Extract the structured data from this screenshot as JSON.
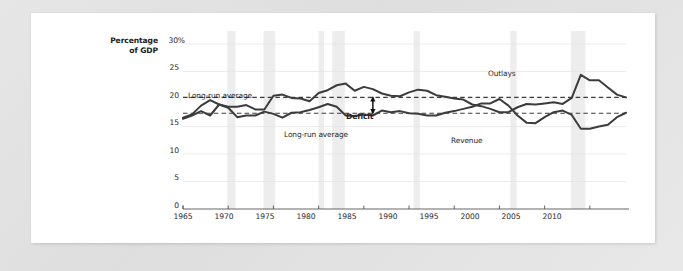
{
  "page": {
    "background_color": "#e3e3e3",
    "sheet_color": "#ffffff"
  },
  "chart_data": {
    "type": "line",
    "title": "",
    "subtitle": "",
    "xlabel": "",
    "ylabel": "Percentage of GDP",
    "ylabel_line1": "Percentage",
    "ylabel_line2": "of GDP",
    "xlim": [
      1965,
      2014
    ],
    "ylim": [
      0,
      30
    ],
    "ytick_labels": [
      "0",
      "5",
      "10",
      "15",
      "20",
      "25",
      "30%"
    ],
    "ytick_values": [
      0,
      5,
      10,
      15,
      20,
      25,
      30
    ],
    "xtick_labels": [
      "1965",
      "1970",
      "1975",
      "1980",
      "1985",
      "1990",
      "1995",
      "2000",
      "2005",
      "2010"
    ],
    "xtick_values": [
      1965,
      1970,
      1975,
      1980,
      1985,
      1990,
      1995,
      2000,
      2005,
      2010
    ],
    "grid": true,
    "legend": "inline-annotations",
    "line_color": "#3c3c3c",
    "reference_line_color": "#3c3c3c",
    "recession_band_color": "#ededed",
    "annotations": [
      {
        "name": "outlays-average-label",
        "text": "Long-run average",
        "x": 1969.2,
        "y": 21.6
      },
      {
        "name": "revenue-average-label",
        "text": "Long-run average",
        "x": 1980.6,
        "y": 15.6
      },
      {
        "name": "deficit-label",
        "text": "Deficit",
        "x": 1986.4,
        "y": 18.6
      },
      {
        "name": "outlays-label",
        "text": "Outlays",
        "x": 2006.0,
        "y": 25.4
      },
      {
        "name": "revenue-label",
        "text": "Revenue",
        "x": 2003.6,
        "y": 13.6
      }
    ],
    "reference_lines": [
      {
        "name": "outlays-long-run-average",
        "value": 20.3,
        "style": "dashed"
      },
      {
        "name": "revenue-long-run-average",
        "value": 17.4,
        "style": "dashed"
      }
    ],
    "deficit_arrow": {
      "x": 1986.0,
      "y_top": 20.3,
      "y_bottom": 17.4
    },
    "recession_bands": [
      {
        "start": 1969.9,
        "end": 1970.8
      },
      {
        "start": 1973.9,
        "end": 1975.2
      },
      {
        "start": 1980.0,
        "end": 1980.6
      },
      {
        "start": 1981.5,
        "end": 1982.9
      },
      {
        "start": 1990.5,
        "end": 1991.2
      },
      {
        "start": 2001.2,
        "end": 2001.9
      },
      {
        "start": 2007.9,
        "end": 2009.5
      }
    ],
    "series": [
      {
        "name": "Outlays",
        "x": [
          1965,
          1966,
          1967,
          1968,
          1969,
          1970,
          1971,
          1972,
          1973,
          1974,
          1975,
          1976,
          1977,
          1978,
          1979,
          1980,
          1981,
          1982,
          1983,
          1984,
          1985,
          1986,
          1987,
          1988,
          1989,
          1990,
          1991,
          1992,
          1993,
          1994,
          1995,
          1996,
          1997,
          1998,
          1999,
          2000,
          2001,
          2002,
          2003,
          2004,
          2005,
          2006,
          2007,
          2008,
          2009,
          2010,
          2011,
          2012,
          2013,
          2014
        ],
        "values": [
          16.6,
          17.2,
          18.8,
          19.8,
          19.0,
          18.6,
          18.6,
          18.9,
          18.1,
          18.1,
          20.6,
          20.8,
          20.2,
          20.1,
          19.6,
          21.1,
          21.6,
          22.5,
          22.8,
          21.5,
          22.2,
          21.8,
          21.0,
          20.6,
          20.5,
          21.2,
          21.7,
          21.5,
          20.7,
          20.4,
          20.1,
          19.9,
          19.0,
          18.7,
          18.2,
          17.6,
          17.6,
          18.5,
          19.1,
          19.0,
          19.2,
          19.4,
          19.1,
          20.2,
          24.4,
          23.4,
          23.4,
          22.1,
          20.8,
          20.3
        ]
      },
      {
        "name": "Revenue",
        "x": [
          1965,
          1966,
          1967,
          1968,
          1969,
          1970,
          1971,
          1972,
          1973,
          1974,
          1975,
          1976,
          1977,
          1978,
          1979,
          1980,
          1981,
          1982,
          1983,
          1984,
          1985,
          1986,
          1987,
          1988,
          1989,
          1990,
          1991,
          1992,
          1993,
          1994,
          1995,
          1996,
          1997,
          1998,
          1999,
          2000,
          2001,
          2002,
          2003,
          2004,
          2005,
          2006,
          2007,
          2008,
          2009,
          2010,
          2011,
          2012,
          2013,
          2014
        ],
        "values": [
          16.4,
          17.0,
          17.8,
          17.0,
          19.0,
          18.4,
          16.7,
          17.0,
          17.0,
          17.7,
          17.3,
          16.6,
          17.5,
          17.6,
          18.0,
          18.5,
          19.1,
          18.6,
          17.0,
          16.9,
          17.2,
          17.0,
          17.9,
          17.6,
          17.8,
          17.4,
          17.3,
          17.0,
          17.0,
          17.5,
          17.8,
          18.2,
          18.6,
          19.2,
          19.2,
          20.0,
          18.8,
          17.0,
          15.7,
          15.6,
          16.7,
          17.6,
          17.9,
          17.1,
          14.6,
          14.6,
          15.0,
          15.3,
          16.7,
          17.5
        ]
      }
    ]
  }
}
